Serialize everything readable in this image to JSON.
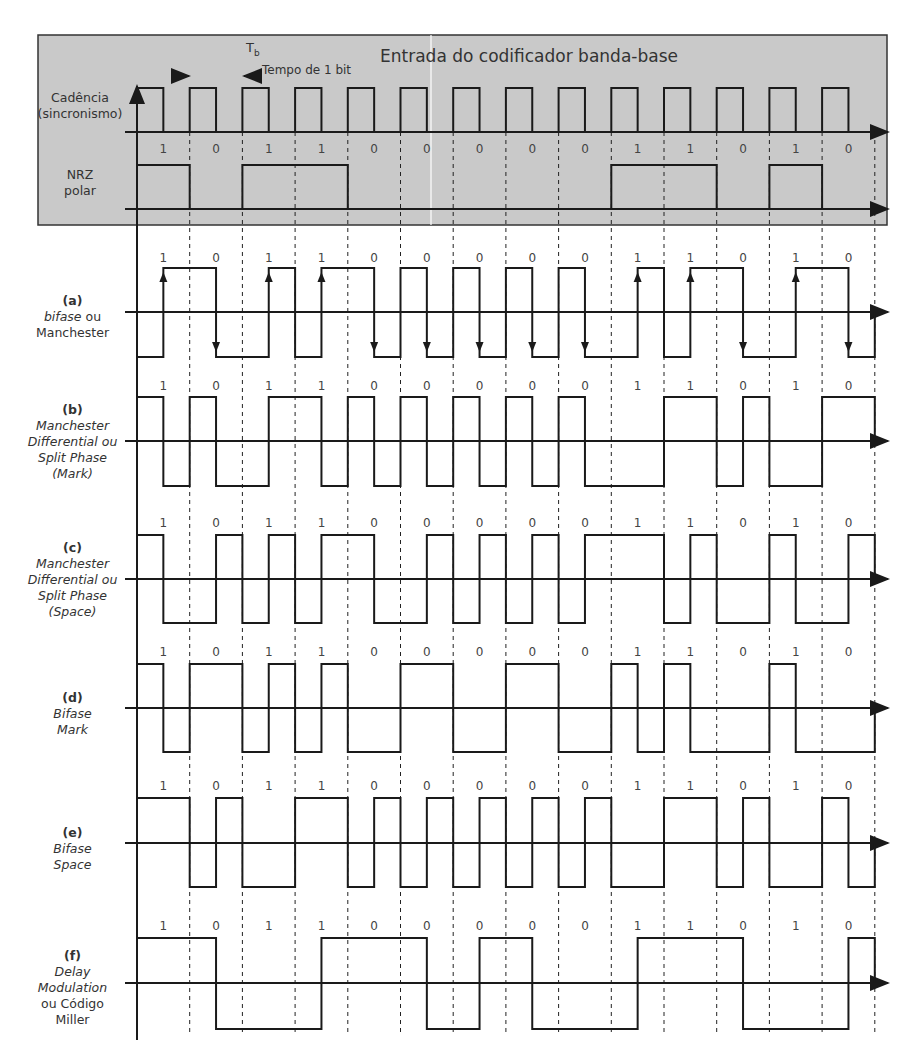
{
  "title": "Entrada do codificador banda-base",
  "bit_time": {
    "symbol": "T",
    "subscript": "b",
    "label": "Tempo de 1 bit"
  },
  "bits": [
    "1",
    "0",
    "1",
    "1",
    "0",
    "0",
    "0",
    "0",
    "0",
    "1",
    "1",
    "0",
    "1",
    "0"
  ],
  "geometry": {
    "x0": 137,
    "pitch": 52.7,
    "nbits": 14
  },
  "colors": {
    "box_fill": "#c9c9c9",
    "line": "#1a1a1a",
    "text": "#333333"
  },
  "signals": [
    {
      "id": "clock",
      "label_lines": [
        "Cadência",
        "(sincronismo)"
      ],
      "label_y": 90,
      "axis_y": 132,
      "high_y": 88,
      "low_y": 132,
      "in_box": true,
      "halves": [
        1,
        0,
        1,
        0,
        1,
        0,
        1,
        0,
        1,
        0,
        1,
        0,
        1,
        0,
        1,
        0,
        1,
        0,
        1,
        0,
        1,
        0,
        1,
        0,
        1,
        0,
        1,
        0
      ]
    },
    {
      "id": "nrz",
      "label_lines": [
        "NRZ",
        "polar"
      ],
      "label_y": 167,
      "axis_y": 209,
      "high_y": 165,
      "low_y": 209,
      "in_box": true,
      "show_bits_y": 153,
      "halves": [
        1,
        1,
        0,
        0,
        1,
        1,
        1,
        1,
        0,
        0,
        0,
        0,
        0,
        0,
        0,
        0,
        0,
        0,
        1,
        1,
        1,
        1,
        0,
        0,
        1,
        1,
        0,
        0
      ]
    },
    {
      "id": "a",
      "tag": "(a)",
      "label_lines": [
        "bifase ou",
        "Manchester"
      ],
      "italic_first_word": "bifase",
      "label_y": 293,
      "axis_y": 312,
      "high_y": 268,
      "low_y": 357,
      "show_bits_y": 262,
      "arrows": true,
      "halves": [
        0,
        1,
        1,
        0,
        0,
        1,
        0,
        1,
        1,
        0,
        1,
        0,
        1,
        0,
        1,
        0,
        1,
        0,
        0,
        1,
        0,
        1,
        1,
        0,
        0,
        1,
        1,
        0
      ]
    },
    {
      "id": "b",
      "tag": "(b)",
      "label_lines": [
        "Manchester",
        "Differential ou",
        "Split Phase",
        "(Mark)"
      ],
      "italic": true,
      "label_y": 402,
      "axis_y": 441,
      "high_y": 397,
      "low_y": 486,
      "show_bits_y": 390,
      "halves": [
        1,
        0,
        1,
        0,
        0,
        1,
        1,
        0,
        1,
        0,
        1,
        0,
        1,
        0,
        1,
        0,
        1,
        0,
        0,
        0,
        1,
        1,
        0,
        1,
        0,
        0,
        1,
        1
      ]
    },
    {
      "id": "c",
      "tag": "(c)",
      "label_lines": [
        "Manchester",
        "Differential ou",
        "Split Phase",
        "(Space)"
      ],
      "italic": true,
      "label_y": 540,
      "axis_y": 579,
      "high_y": 535,
      "low_y": 623,
      "show_bits_y": 527,
      "halves": [
        1,
        0,
        0,
        1,
        0,
        1,
        0,
        1,
        1,
        0,
        0,
        1,
        0,
        1,
        0,
        1,
        0,
        1,
        1,
        1,
        0,
        1,
        0,
        0,
        1,
        0,
        0,
        1
      ]
    },
    {
      "id": "d",
      "tag": "(d)",
      "label_lines": [
        "Bifase",
        "Mark"
      ],
      "italic": true,
      "label_y": 690,
      "axis_y": 708,
      "high_y": 664,
      "low_y": 752,
      "show_bits_y": 656,
      "halves": [
        1,
        0,
        1,
        1,
        0,
        1,
        0,
        1,
        0,
        0,
        1,
        1,
        0,
        0,
        1,
        1,
        0,
        0,
        1,
        0,
        1,
        0,
        0,
        0,
        1,
        0,
        0,
        0
      ]
    },
    {
      "id": "e",
      "tag": "(e)",
      "label_lines": [
        "Bifase",
        "Space"
      ],
      "italic": true,
      "label_y": 825,
      "axis_y": 843,
      "high_y": 798,
      "low_y": 887,
      "show_bits_y": 790,
      "halves": [
        1,
        1,
        0,
        1,
        0,
        0,
        1,
        1,
        0,
        1,
        0,
        1,
        0,
        1,
        0,
        1,
        0,
        1,
        0,
        0,
        1,
        1,
        0,
        1,
        0,
        0,
        1,
        0
      ]
    },
    {
      "id": "f",
      "tag": "(f)",
      "label_lines": [
        "Delay",
        "Modulation",
        "ou Código",
        "Miller"
      ],
      "italic_lines": [
        0,
        1
      ],
      "label_y": 948,
      "axis_y": 983,
      "high_y": 938,
      "low_y": 1029,
      "show_bits_y": 930,
      "halves": [
        1,
        1,
        1,
        0,
        0,
        0,
        0,
        1,
        1,
        1,
        1,
        0,
        0,
        1,
        1,
        0,
        0,
        0,
        0,
        1,
        1,
        1,
        1,
        0,
        0,
        0,
        0,
        1
      ]
    }
  ]
}
